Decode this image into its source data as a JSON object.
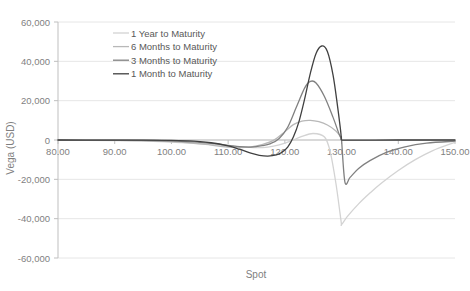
{
  "chart_data": {
    "type": "line",
    "title": "",
    "xlabel": "Spot",
    "ylabel": "Vega (USD)",
    "xlim": [
      80,
      150
    ],
    "ylim": [
      -60000,
      60000
    ],
    "grid": true,
    "legend_position": "top-center-inside",
    "x_ticks": [
      "80.00",
      "90.00",
      "100.00",
      "110.00",
      "120.00",
      "130.00",
      "140.00",
      "150.00"
    ],
    "x_tick_values": [
      80,
      90,
      100,
      110,
      120,
      130,
      140,
      150
    ],
    "y_ticks": [
      "60,000",
      "40,000",
      "20,000",
      "0",
      "-20,000",
      "-40,000",
      "-60,000"
    ],
    "y_tick_values": [
      60000,
      40000,
      20000,
      0,
      -20000,
      -40000,
      -60000
    ],
    "series": [
      {
        "name": "1 Year to Maturity",
        "color": "#d3d3d3",
        "x": [
          80,
          85,
          90,
          95,
          100,
          103,
          106,
          109,
          112,
          115,
          117,
          119,
          121,
          123,
          125,
          127,
          128,
          129,
          129.9,
          130,
          131,
          133,
          135,
          137,
          140,
          143,
          146,
          150
        ],
        "values": [
          -60,
          -120,
          -260,
          -520,
          -1050,
          -1500,
          -2100,
          -2800,
          -3500,
          -3900,
          -3600,
          -2500,
          -600,
          1800,
          3300,
          1500,
          -6000,
          -22000,
          -41000,
          -43000,
          -39000,
          -32500,
          -27000,
          -22000,
          -15500,
          -10000,
          -5500,
          -1200
        ]
      },
      {
        "name": "6 Months to Maturity",
        "color": "#b8b8b8",
        "x": [
          80,
          85,
          90,
          95,
          100,
          103,
          106,
          109,
          112,
          114,
          116,
          118,
          120,
          121.5,
          123,
          124.5,
          126,
          127.5,
          129,
          129.9,
          130,
          131,
          133,
          135,
          138,
          141,
          145,
          150
        ],
        "values": [
          -30,
          -70,
          -160,
          -360,
          -850,
          -1400,
          -2250,
          -3300,
          -3900,
          -3500,
          -2300,
          -200,
          4200,
          7800,
          9600,
          10000,
          9300,
          7600,
          4600,
          1300,
          0,
          -200,
          -180,
          -150,
          -110,
          -80,
          -45,
          -15
        ]
      },
      {
        "name": "3 Months to Maturity",
        "color": "#808080",
        "x": [
          80,
          86,
          92,
          97,
          101,
          104,
          107,
          110,
          112,
          114,
          116,
          117.5,
          119,
          120.5,
          122,
          123.5,
          124.5,
          125.5,
          127,
          128.5,
          129.5,
          129.95,
          130,
          130.6,
          131.5,
          133,
          135,
          138,
          141,
          145,
          150
        ],
        "values": [
          -20,
          -45,
          -110,
          -260,
          -560,
          -1000,
          -1700,
          -2700,
          -3400,
          -3600,
          -2900,
          -1800,
          800,
          6500,
          16500,
          26500,
          29800,
          29000,
          22000,
          11500,
          3500,
          600,
          0,
          -21500,
          -19000,
          -14500,
          -10500,
          -6200,
          -3600,
          -1600,
          -600
        ]
      },
      {
        "name": "1 Month to Maturity",
        "color": "#404040",
        "x": [
          80,
          88,
          95,
          100,
          104,
          107,
          110,
          112,
          114,
          115.5,
          117,
          118.5,
          119.5,
          120.5,
          121.5,
          122.5,
          123.5,
          124.5,
          125.5,
          126.5,
          127.5,
          128.5,
          129.3,
          129.8,
          129.95,
          130,
          131,
          133,
          136,
          140,
          145,
          150
        ],
        "values": [
          -10,
          -25,
          -80,
          -230,
          -600,
          -1400,
          -3000,
          -4700,
          -6700,
          -7800,
          -8200,
          -7600,
          -6200,
          -3600,
          1500,
          9500,
          21000,
          34000,
          44000,
          47800,
          45000,
          33000,
          17000,
          5500,
          1200,
          0,
          -40,
          -30,
          -20,
          -12,
          -6,
          -2
        ]
      }
    ]
  },
  "legend": {
    "items": [
      {
        "label": "1 Year to Maturity"
      },
      {
        "label": "6 Months to Maturity"
      },
      {
        "label": "3 Months to Maturity"
      },
      {
        "label": "1 Month to Maturity"
      }
    ]
  },
  "axes": {
    "x_title": "Spot",
    "y_title": "Vega (USD)"
  },
  "colors": {
    "grid": "#e6e6e6",
    "axis_line": "#bfbfbf",
    "tick_label": "#7f7f7f",
    "legend_label": "#595959",
    "background": "#ffffff"
  }
}
